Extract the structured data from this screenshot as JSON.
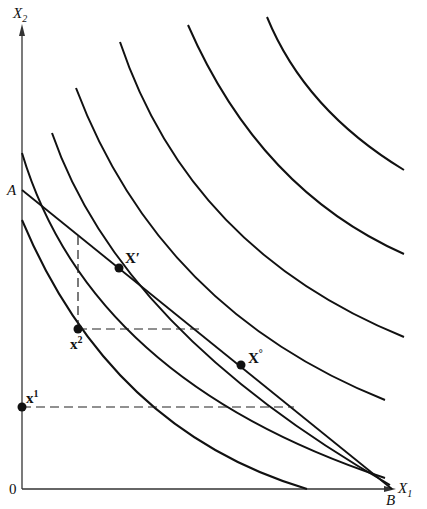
{
  "diagram": {
    "type": "indifference-curve-budget-line",
    "axes": {
      "x_label": "X",
      "x_sub": "1",
      "y_label": "X",
      "y_sub": "2",
      "origin_label": "0"
    },
    "budget_line": {
      "start_label": "A",
      "end_label": "B"
    },
    "points": [
      {
        "name": "x-prime",
        "label": "X",
        "sup": "′"
      },
      {
        "name": "x-two",
        "label": "x",
        "sup": "2"
      },
      {
        "name": "x-optimum",
        "label": "X",
        "sup": "°"
      },
      {
        "name": "x-one",
        "label": "x",
        "sup": "1"
      }
    ],
    "indifference_curve_count": 7,
    "colors": {
      "line": "#111111",
      "background": "#ffffff"
    }
  }
}
